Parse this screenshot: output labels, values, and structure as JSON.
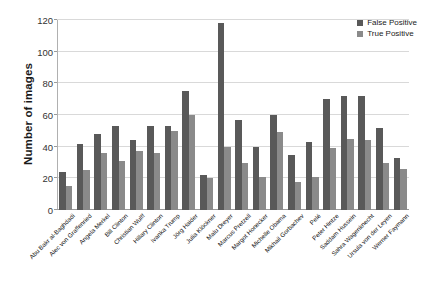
{
  "chart_data": {
    "type": "bar",
    "title": "",
    "xlabel": "",
    "ylabel": "Number of images",
    "ylim": [
      0,
      120
    ],
    "yticks": [
      0,
      20,
      40,
      60,
      80,
      100,
      120
    ],
    "grid": true,
    "legend_position": "top-right",
    "categories": [
      "Abu Bakr al-Baghdadi",
      "Alec von Graffenried",
      "Angela Merkel",
      "Bill Clinton",
      "Christian Wulff",
      "Hillary Clinton",
      "Ivanka Trump",
      "Jörg Haider",
      "Julia Klöckner",
      "Malu Dreyer",
      "Marcus Pretzell",
      "Margot Honecker",
      "Michelle Obama",
      "Mikhail Gorbachev",
      "Pelé",
      "Peter Hintze",
      "Saddam Hussein",
      "Sahra Wagenknecht",
      "Ursula von der Leyen",
      "Werner Faymann"
    ],
    "series": [
      {
        "name": "False Positive",
        "color": "#595959",
        "values": [
          24,
          42,
          48,
          53,
          44,
          53,
          53,
          75,
          22,
          68,
          57,
          40,
          60,
          35,
          43,
          70,
          72,
          72,
          52,
          33
        ]
      },
      {
        "name": "True Positive",
        "color": "#8a8a8a",
        "values": [
          15,
          25,
          36,
          31,
          37,
          36,
          50,
          60,
          20,
          40,
          30,
          21,
          49,
          18,
          21,
          39,
          45,
          44,
          30,
          26
        ]
      }
    ],
    "annotations": [
      {
        "category": "Malu Dreyer",
        "note": "tallest False Positive bar",
        "value": 118
      }
    ]
  },
  "legend": {
    "items": [
      {
        "label": "False Positive",
        "color": "#595959"
      },
      {
        "label": "True Positive",
        "color": "#8a8a8a"
      }
    ]
  }
}
